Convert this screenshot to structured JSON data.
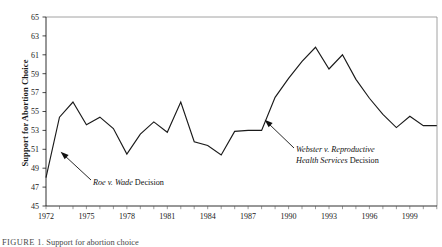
{
  "chart_data": {
    "type": "line",
    "title": "",
    "xlabel": "",
    "ylabel": "Support for Abortion Choice",
    "xlim": [
      1972,
      2001
    ],
    "ylim": [
      45,
      65
    ],
    "grid": false,
    "legend": "none",
    "y_ticks": [
      45,
      47,
      49,
      51,
      53,
      55,
      57,
      59,
      61,
      63,
      65
    ],
    "x_ticks": [
      1972,
      1975,
      1978,
      1981,
      1984,
      1987,
      1990,
      1993,
      1996,
      1999
    ],
    "x": [
      1972,
      1973,
      1974,
      1975,
      1976,
      1977,
      1978,
      1979,
      1980,
      1981,
      1982,
      1983,
      1984,
      1985,
      1986,
      1987,
      1988,
      1989,
      1990,
      1991,
      1992,
      1993,
      1994,
      1995,
      1996,
      1997,
      1998,
      1999,
      2000,
      2001
    ],
    "series": [
      {
        "name": "Support for Abortion Choice",
        "values": [
          48.0,
          54.4,
          56.0,
          53.6,
          54.4,
          53.2,
          50.5,
          52.6,
          53.9,
          52.8,
          56.0,
          51.8,
          51.4,
          50.4,
          52.9,
          53.0,
          53.0,
          56.5,
          58.5,
          60.3,
          61.8,
          59.5,
          61.0,
          58.4,
          56.4,
          54.7,
          53.3,
          54.5,
          53.5,
          53.5
        ]
      }
    ],
    "annotations": [
      {
        "id": "roe",
        "text_italic": "Roe v. Wade",
        "text_plain": " Decision",
        "full_text": "Roe v. Wade Decision",
        "points_to_year": 1973,
        "points_to_value": 51.0
      },
      {
        "id": "webster",
        "line1_italic": "Webster v. Reproductive",
        "line2_italic": "Health Services",
        "line2_plain": " Decision",
        "full_text": "Webster v. Reproductive Health Services Decision",
        "points_to_year": 1989,
        "points_to_value": 55.2
      }
    ]
  },
  "caption": {
    "label": "FIGURE 1.",
    "text": "Support for abortion choice"
  },
  "colors": {
    "line": "#1a1a1a",
    "axis": "#1a1a1a",
    "frame": "#8c8c8c",
    "background": "#ffffff"
  }
}
